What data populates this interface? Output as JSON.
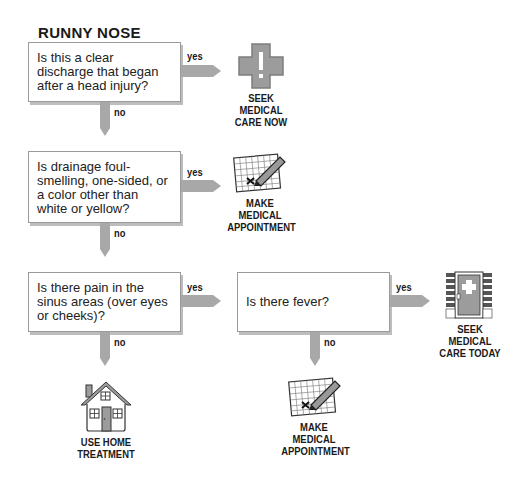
{
  "title": "RUNNY NOSE",
  "colors": {
    "arrow": "#a8a8a8",
    "box_border": "#9a9a9a",
    "icon_gray": "#9c9c9c"
  },
  "questions": [
    {
      "id": "q1",
      "text": "Is this a clear discharge that began after a head injury?",
      "yes": "yes",
      "no": "no"
    },
    {
      "id": "q2",
      "text": "Is drainage foul-smelling, one-sided, or a color other than white or yellow?",
      "yes": "yes",
      "no": "no"
    },
    {
      "id": "q3",
      "text": "Is there pain in the sinus areas (over eyes or cheeks)?",
      "yes": "yes",
      "no": "no"
    },
    {
      "id": "q4",
      "text": "Is there fever?",
      "yes": "yes",
      "no": "no"
    }
  ],
  "outcomes": [
    {
      "id": "o1",
      "icon": "medical-cross-icon",
      "lines": [
        "SEEK",
        "MEDICAL",
        "CARE NOW"
      ]
    },
    {
      "id": "o2",
      "icon": "calendar-pencil-icon",
      "lines": [
        "MAKE",
        "MEDICAL",
        "APPOINTMENT"
      ]
    },
    {
      "id": "o3",
      "icon": "hospital-door-icon",
      "lines": [
        "SEEK",
        "MEDICAL",
        "CARE TODAY"
      ]
    },
    {
      "id": "o4",
      "icon": "house-icon",
      "lines": [
        "USE HOME",
        "TREATMENT"
      ]
    },
    {
      "id": "o5",
      "icon": "calendar-pencil-icon",
      "lines": [
        "MAKE",
        "MEDICAL",
        "APPOINTMENT"
      ]
    }
  ]
}
